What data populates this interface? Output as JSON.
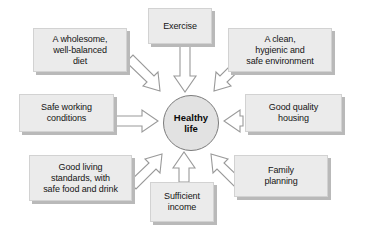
{
  "diagram": {
    "type": "radial-converging",
    "center": {
      "id": "healthy-life",
      "label": "Healthy\nlife",
      "shape": "circle",
      "fill": "#e2e2e2",
      "stroke": "#7c7c7c"
    },
    "nodes": [
      {
        "id": "exercise",
        "label": "Exercise",
        "position": "top"
      },
      {
        "id": "diet",
        "label": "A wholesome,\nwell-balanced\ndiet",
        "position": "top-left"
      },
      {
        "id": "environment",
        "label": "A clean,\nhygienic and\nsafe environment",
        "position": "top-right"
      },
      {
        "id": "safe-working",
        "label": "Safe working\nconditions",
        "position": "left"
      },
      {
        "id": "housing",
        "label": "Good quality\nhousing",
        "position": "right"
      },
      {
        "id": "living",
        "label": "Good living\nstandards, with\nsafe food and drink",
        "position": "bottom-left"
      },
      {
        "id": "income",
        "label": "Sufficient\nincome",
        "position": "bottom"
      },
      {
        "id": "family",
        "label": "Family\nplanning",
        "position": "bottom-right"
      }
    ],
    "arrows": {
      "count": 8,
      "direction": "inward-to-center",
      "style": "block-arrow",
      "fill": "#ffffff",
      "stroke": "#9a9a9a"
    },
    "colors": {
      "box_fill": "#ebebeb",
      "box_border": "#d2d2d2",
      "box_shadow": "#b9b9b9",
      "text": "#141414",
      "background": "#ffffff"
    }
  }
}
